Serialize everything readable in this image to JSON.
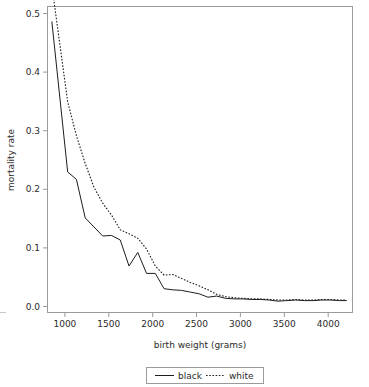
{
  "chart_data": {
    "type": "line",
    "title": "",
    "xlabel": "birth weight (grams)",
    "ylabel": "mortality rate",
    "xlim": [
      820,
      4300
    ],
    "ylim": [
      -0.02,
      0.52
    ],
    "xticks": [
      1000,
      1500,
      2000,
      2500,
      3000,
      3500,
      4000
    ],
    "xticklabels": [
      "1000",
      "1500",
      "2000",
      "2500",
      "3000",
      "3500",
      "4000"
    ],
    "yticks": [
      0.0,
      0.1,
      0.2,
      0.3,
      0.4,
      0.5
    ],
    "yticklabels": [
      "0.0",
      "0.1",
      "0.2",
      "0.3",
      "0.4",
      "0.5"
    ],
    "grid": false,
    "legend_position": "below-axes",
    "series": [
      {
        "name": "black",
        "style": "solid",
        "color": "#1d1d1d",
        "x": [
          870,
          1050,
          1150,
          1250,
          1350,
          1450,
          1550,
          1650,
          1750,
          1850,
          1950,
          2050,
          2150,
          2250,
          2350,
          2450,
          2550,
          2650,
          2750,
          2850,
          2950,
          3050,
          3150,
          3250,
          3350,
          3450,
          3550,
          3650,
          3750,
          3850,
          3950,
          4050,
          4150,
          4230
        ],
        "y": [
          0.493,
          0.228,
          0.215,
          0.147,
          0.131,
          0.115,
          0.116,
          0.108,
          0.062,
          0.086,
          0.049,
          0.049,
          0.022,
          0.02,
          0.019,
          0.016,
          0.013,
          0.007,
          0.009,
          0.005,
          0.004,
          0.004,
          0.003,
          0.003,
          0.002,
          0.0,
          0.001,
          0.002,
          0.001,
          0.001,
          0.002,
          0.002,
          0.001,
          0.001
        ]
      },
      {
        "name": "white",
        "style": "dotted",
        "color": "#1d1d1d",
        "x": [
          880,
          1050,
          1150,
          1250,
          1350,
          1450,
          1550,
          1650,
          1750,
          1850,
          1950,
          2050,
          2150,
          2250,
          2350,
          2450,
          2550,
          2650,
          2750,
          2850,
          2950,
          3050,
          3150,
          3250,
          3350,
          3450,
          3550,
          3650,
          3750,
          3850,
          3950,
          4050,
          4150,
          4230
        ],
        "y": [
          0.545,
          0.352,
          0.292,
          0.243,
          0.201,
          0.173,
          0.152,
          0.126,
          0.119,
          0.111,
          0.092,
          0.062,
          0.046,
          0.047,
          0.04,
          0.033,
          0.027,
          0.02,
          0.012,
          0.008,
          0.006,
          0.005,
          0.004,
          0.004,
          0.003,
          0.002,
          0.002,
          0.003,
          0.002,
          0.002,
          0.003,
          0.003,
          0.002,
          0.002
        ]
      }
    ],
    "legend": [
      {
        "label": "black",
        "style": "solid"
      },
      {
        "label": "white",
        "style": "dotted"
      }
    ]
  }
}
